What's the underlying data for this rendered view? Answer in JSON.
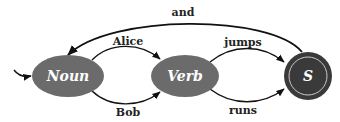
{
  "diagram": {
    "type": "finite-state-automaton",
    "colors": {
      "state_fill": "#6b6b6b",
      "final_state_fill": "#3a3a3a",
      "final_state_ring": "#c8c8c8",
      "edge": "#111111",
      "label_text": "#222222",
      "node_text": "#ffffff"
    },
    "nodes": [
      {
        "id": "noun",
        "label": "Noun",
        "initial": true,
        "final": false
      },
      {
        "id": "verb",
        "label": "Verb",
        "initial": false,
        "final": false
      },
      {
        "id": "s",
        "label": "S",
        "initial": false,
        "final": true
      }
    ],
    "edges": [
      {
        "from": "noun",
        "to": "verb",
        "label": "Alice"
      },
      {
        "from": "noun",
        "to": "verb",
        "label": "Bob"
      },
      {
        "from": "verb",
        "to": "s",
        "label": "jumps"
      },
      {
        "from": "verb",
        "to": "s",
        "label": "runs"
      },
      {
        "from": "s",
        "to": "noun",
        "label": "and"
      }
    ]
  }
}
